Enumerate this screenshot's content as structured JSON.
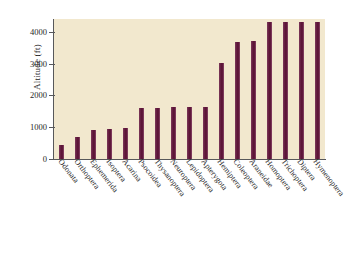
{
  "chart_data": {
    "type": "bar",
    "title": "",
    "subtitle": "",
    "xlabel": "",
    "ylabel": "Altitude (ft)",
    "ylim": [
      0,
      4400
    ],
    "yticks": [
      0,
      1000,
      2000,
      3000,
      4000
    ],
    "ytick_labels": [
      "0",
      "1000",
      "2000",
      "3000",
      "4000"
    ],
    "grid": false,
    "legend": null,
    "bar_color": "#6b1f47",
    "plot_background": "#f2e8ce",
    "categories": [
      "Odonata",
      "Orthoptera",
      "Ephemerida",
      "Isoptera",
      "Acarina",
      "Psocoidea",
      "Thysanoptera",
      "Neuroptera",
      "Lepidoptera",
      "Apterygota",
      "Hemiptera",
      "Coleoptera",
      "Araneidae",
      "Homoptera",
      "Trichoptera",
      "Diptera",
      "Hymenoptera"
    ],
    "values": [
      450,
      700,
      900,
      930,
      970,
      1600,
      1600,
      1630,
      1630,
      1630,
      3020,
      3670,
      3720,
      4300,
      4300,
      4300,
      4300
    ]
  }
}
